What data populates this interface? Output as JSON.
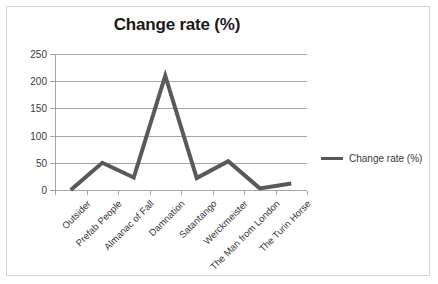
{
  "chart_data": {
    "type": "line",
    "title": "Change rate (%)",
    "xlabel": "",
    "ylabel": "",
    "categories": [
      "Outsider",
      "Prefab People",
      "Almanac of Fall",
      "Damnation",
      "Satantango",
      "Werckmeister",
      "The Man from London",
      "The Turin Horse"
    ],
    "series": [
      {
        "name": "Change rate (%)",
        "values": [
          0,
          50,
          23,
          210,
          22,
          53,
          3,
          12
        ],
        "color": "#595959"
      }
    ],
    "ylim": [
      0,
      250
    ],
    "yticks": [
      0,
      50,
      100,
      150,
      200,
      250
    ],
    "ytick_labels": [
      "0",
      "50",
      "100",
      "150",
      "200",
      "250"
    ],
    "grid": true,
    "legend_position": "right",
    "legend_entries": [
      "Change rate (%)"
    ]
  },
  "legend": {
    "label": "Change rate (%)",
    "marker_name": "line-marker"
  },
  "colors": {
    "line": "#595959",
    "grid": "#a6a6a6",
    "axis": "#a6a6a6",
    "text": "#3a3a3a",
    "title": "#1a1a1a",
    "frame_border": "#d4d4d4",
    "background": "#ffffff"
  }
}
